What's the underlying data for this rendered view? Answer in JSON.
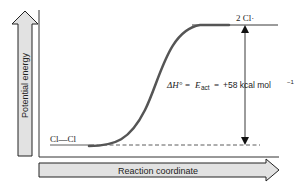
{
  "diagram": {
    "y_axis_label": "Potential energy",
    "x_axis_label": "Reaction coordinate",
    "reactant_label": "Cl—Cl",
    "product_label": "2 Cl·",
    "energy_label": {
      "delta_h": "ΔH°",
      "equals1": "=",
      "e_act": "E",
      "e_act_sub": "act",
      "equals2": "=",
      "value": "+58 kcal mol",
      "exponent": "−1"
    },
    "colors": {
      "curve": "#555555",
      "arrow_fill": "#e2e2e2",
      "line": "#111111"
    }
  }
}
